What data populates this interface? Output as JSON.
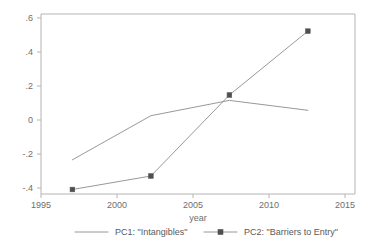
{
  "chart_data": {
    "type": "line",
    "title": "",
    "subtitle": "",
    "xlabel": "year",
    "ylabel": "",
    "xlim": [
      1995,
      2015
    ],
    "ylim": [
      -0.4,
      0.6
    ],
    "xticks": [
      1995,
      2000,
      2005,
      2010,
      2015
    ],
    "xtick_labels": [
      "1995",
      "2000",
      "2005",
      "2010",
      "2015"
    ],
    "yticks": [
      -0.4,
      -0.2,
      0,
      0.2,
      0.4,
      0.6
    ],
    "ytick_labels": [
      "-.4",
      "-.2",
      "0",
      ".2",
      ".4",
      ".6"
    ],
    "grid": false,
    "legend_position": "bottom",
    "series": [
      {
        "name": "PC1: \"Intangibles\"",
        "marker": "none",
        "color": "#8c8c8c",
        "x": [
          1997,
          2002,
          2007,
          2012
        ],
        "values": [
          -0.21,
          0.035,
          0.12,
          0.065
        ]
      },
      {
        "name": "PC2: \"Barriers to Entry\"",
        "marker": "square",
        "color": "#8c8c8c",
        "x": [
          1997,
          2002,
          2007,
          2012
        ],
        "values": [
          -0.375,
          -0.3,
          0.15,
          0.505
        ]
      }
    ]
  },
  "legend": {
    "items": [
      {
        "label": "PC1: \"Intangibles\"",
        "marker": "none"
      },
      {
        "label": "PC2: \"Barriers to Entry\"",
        "marker": "square"
      }
    ]
  },
  "colors": {
    "series_line": "#8c8c8c",
    "marker_fill": "#4f4f4f",
    "frame": "#b4b4b4",
    "text": "#6e6e6e",
    "background": "#ffffff"
  }
}
